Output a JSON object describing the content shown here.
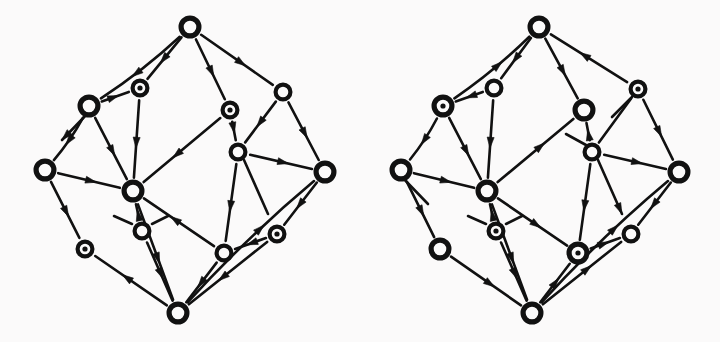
{
  "figure": {
    "background_color": "#fbfafa",
    "ink_color": "#111111",
    "width": 720,
    "height": 342,
    "panel_count": 2
  },
  "style": {
    "node_radius": 9.5,
    "node_radius_large": 11,
    "node_stroke_width": 4.2,
    "dot_radius": 2.6,
    "edge_stroke_width": 2.6,
    "arrow_length": 11,
    "arrow_width": 7
  },
  "panels": [
    {
      "id": "left-panel",
      "name": "left-graph",
      "label": "Left oriented hypercube",
      "nodes": [
        {
          "id": "L0",
          "name": "node-top",
          "x": 190,
          "y": 27,
          "kind": "ring",
          "size": "large"
        },
        {
          "id": "L1",
          "name": "node-upper-left-dot",
          "x": 140,
          "y": 88,
          "kind": "dotted",
          "size": "normal"
        },
        {
          "id": "L2",
          "name": "node-left-upper",
          "x": 89,
          "y": 106,
          "kind": "ring",
          "size": "large"
        },
        {
          "id": "L3",
          "name": "node-upper-mid-dot",
          "x": 230,
          "y": 110,
          "kind": "dotted",
          "size": "normal"
        },
        {
          "id": "L4",
          "name": "node-upper-right",
          "x": 283,
          "y": 92,
          "kind": "ring",
          "size": "normal"
        },
        {
          "id": "L5",
          "name": "node-center-right",
          "x": 238,
          "y": 152,
          "kind": "ring",
          "size": "normal"
        },
        {
          "id": "L6",
          "name": "node-left",
          "x": 45,
          "y": 170,
          "kind": "ring",
          "size": "large"
        },
        {
          "id": "L7",
          "name": "node-center-left",
          "x": 133,
          "y": 191,
          "kind": "ring",
          "size": "large"
        },
        {
          "id": "L8",
          "name": "node-right",
          "x": 325,
          "y": 172,
          "kind": "ring",
          "size": "large"
        },
        {
          "id": "L9",
          "name": "node-inner-lower",
          "x": 142,
          "y": 231,
          "kind": "ring",
          "size": "normal"
        },
        {
          "id": "L10",
          "name": "node-lower-left-dot",
          "x": 85,
          "y": 249,
          "kind": "dotted",
          "size": "normal"
        },
        {
          "id": "L11",
          "name": "node-lower-mid",
          "x": 224,
          "y": 253,
          "kind": "ring",
          "size": "normal"
        },
        {
          "id": "L12",
          "name": "node-lower-right-dot",
          "x": 277,
          "y": 234,
          "kind": "dotted",
          "size": "normal"
        },
        {
          "id": "L13",
          "name": "node-bottom",
          "x": 178,
          "y": 313,
          "kind": "ring",
          "size": "large"
        }
      ],
      "edges": [
        {
          "name": "edge-top-to-upper-left-dot",
          "from": "L0",
          "to": "L1",
          "dir": "forward",
          "curve": 0
        },
        {
          "name": "edge-top-to-left-upper",
          "from": "L0",
          "to": "L2",
          "dir": "forward",
          "curve": -7
        },
        {
          "name": "edge-top-to-upper-mid-dot",
          "from": "L0",
          "to": "L3",
          "dir": "forward",
          "curve": 0
        },
        {
          "name": "edge-top-to-upper-right",
          "from": "L0",
          "to": "L4",
          "dir": "forward",
          "curve": 0
        },
        {
          "name": "edge-upper-left-dot-to-left-upper",
          "from": "L1",
          "to": "L2",
          "dir": "backward",
          "curve": 0
        },
        {
          "name": "edge-upper-left-dot-to-center-left",
          "from": "L1",
          "to": "L7",
          "dir": "forward",
          "curve": 0
        },
        {
          "name": "edge-left-upper-to-left",
          "from": "L2",
          "to": "L6",
          "dir": "forward",
          "curve": -6
        },
        {
          "name": "edge-left-upper-to-center-left",
          "from": "L2",
          "to": "L7",
          "dir": "forward",
          "curve": 0
        },
        {
          "name": "edge-upper-mid-dot-to-center-right",
          "from": "L3",
          "to": "L5",
          "dir": "forward",
          "curve": 0
        },
        {
          "name": "edge-upper-mid-dot-to-center-left",
          "from": "L3",
          "to": "L7",
          "dir": "forward",
          "curve": 0
        },
        {
          "name": "edge-upper-right-to-center-right",
          "from": "L4",
          "to": "L5",
          "dir": "forward",
          "curve": 0
        },
        {
          "name": "edge-upper-right-to-right",
          "from": "L4",
          "to": "L8",
          "dir": "forward",
          "curve": 0
        },
        {
          "name": "edge-center-right-to-right",
          "from": "L5",
          "to": "L8",
          "dir": "forward",
          "curve": 0
        },
        {
          "name": "edge-center-right-to-lower-mid",
          "from": "L5",
          "to": "L11",
          "dir": "forward",
          "curve": 0
        },
        {
          "name": "edge-left-to-center-left",
          "from": "L6",
          "to": "L7",
          "dir": "forward",
          "curve": 0
        },
        {
          "name": "edge-left-to-lower-left-dot",
          "from": "L6",
          "to": "L10",
          "dir": "forward",
          "curve": 0
        },
        {
          "name": "edge-center-left-to-inner-lower",
          "from": "L7",
          "to": "L9",
          "dir": "backward",
          "curve": 0
        },
        {
          "name": "edge-center-left-to-lower-mid",
          "from": "L7",
          "to": "L11",
          "dir": "backward",
          "curve": 0
        },
        {
          "name": "edge-center-left-to-bottom",
          "from": "L7",
          "to": "L13",
          "dir": "forward",
          "curve": 0
        },
        {
          "name": "edge-right-to-lower-right-dot",
          "from": "L8",
          "to": "L12",
          "dir": "forward",
          "curve": 0
        },
        {
          "name": "edge-right-to-bottom",
          "from": "L8",
          "to": "L13",
          "dir": "backward",
          "curve": 8
        },
        {
          "name": "edge-inner-lower-to-bottom",
          "from": "L9",
          "to": "L13",
          "dir": "forward",
          "curve": 0
        },
        {
          "name": "edge-lower-left-dot-to-bottom",
          "from": "L10",
          "to": "L13",
          "dir": "backward",
          "curve": 0
        },
        {
          "name": "edge-lower-mid-to-lower-right-dot",
          "from": "L11",
          "to": "L12",
          "dir": "backward",
          "curve": 0
        },
        {
          "name": "edge-lower-mid-to-bottom",
          "from": "L11",
          "to": "L13",
          "dir": "forward",
          "curve": 0
        },
        {
          "name": "edge-lower-right-dot-to-bottom",
          "from": "L12",
          "to": "L13",
          "dir": "forward",
          "curve": 0
        }
      ],
      "stubs": [
        {
          "name": "stub-left-upper-inner",
          "x1": 89,
          "y1": 112,
          "x2": 62,
          "y2": 140,
          "arrow": true,
          "at": "end"
        },
        {
          "name": "stub-inner-lower-left",
          "x1": 132,
          "y1": 224,
          "x2": 114,
          "y2": 216,
          "arrow": false,
          "at": "none"
        },
        {
          "name": "stub-inner-lower-right",
          "x1": 152,
          "y1": 224,
          "x2": 168,
          "y2": 216,
          "arrow": false,
          "at": "none"
        },
        {
          "name": "stub-center-right-down",
          "x1": 244,
          "y1": 160,
          "x2": 268,
          "y2": 214,
          "arrow": false,
          "at": "none"
        }
      ]
    },
    {
      "id": "right-panel",
      "name": "right-graph",
      "label": "Right oriented hypercube",
      "nodes": [
        {
          "id": "R0",
          "name": "node-top",
          "x": 539,
          "y": 27,
          "kind": "ring",
          "size": "large"
        },
        {
          "id": "R1",
          "name": "node-upper-left",
          "x": 494,
          "y": 88,
          "kind": "ring",
          "size": "normal"
        },
        {
          "id": "R2",
          "name": "node-left-upper-dot",
          "x": 443,
          "y": 106,
          "kind": "dotted",
          "size": "large"
        },
        {
          "id": "R3",
          "name": "node-upper-mid",
          "x": 584,
          "y": 110,
          "kind": "ring",
          "size": "large"
        },
        {
          "id": "R4",
          "name": "node-upper-right-dot",
          "x": 638,
          "y": 89,
          "kind": "dotted",
          "size": "normal"
        },
        {
          "id": "R5",
          "name": "node-center-right",
          "x": 592,
          "y": 152,
          "kind": "ring",
          "size": "normal"
        },
        {
          "id": "R6",
          "name": "node-left",
          "x": 401,
          "y": 170,
          "kind": "ring",
          "size": "large"
        },
        {
          "id": "R7",
          "name": "node-center-left",
          "x": 487,
          "y": 191,
          "kind": "ring",
          "size": "large"
        },
        {
          "id": "R8",
          "name": "node-right",
          "x": 679,
          "y": 172,
          "kind": "ring",
          "size": "large"
        },
        {
          "id": "R9",
          "name": "node-inner-lower-dot",
          "x": 496,
          "y": 231,
          "kind": "dotted",
          "size": "normal"
        },
        {
          "id": "R10",
          "name": "node-lower-left",
          "x": 440,
          "y": 249,
          "kind": "ring",
          "size": "large"
        },
        {
          "id": "R11",
          "name": "node-lower-mid-dot",
          "x": 578,
          "y": 253,
          "kind": "dotted",
          "size": "large"
        },
        {
          "id": "R12",
          "name": "node-lower-right",
          "x": 631,
          "y": 234,
          "kind": "ring",
          "size": "normal"
        },
        {
          "id": "R13",
          "name": "node-bottom",
          "x": 532,
          "y": 313,
          "kind": "ring",
          "size": "large"
        }
      ],
      "edges": [
        {
          "name": "edge-top-to-upper-left",
          "from": "R0",
          "to": "R1",
          "dir": "forward",
          "curve": 0
        },
        {
          "name": "edge-top-to-left-upper-dot",
          "from": "R0",
          "to": "R2",
          "dir": "backward",
          "curve": -7
        },
        {
          "name": "edge-top-to-upper-mid",
          "from": "R0",
          "to": "R3",
          "dir": "forward",
          "curve": 0
        },
        {
          "name": "edge-top-to-upper-right-dot",
          "from": "R0",
          "to": "R4",
          "dir": "backward",
          "curve": 0
        },
        {
          "name": "edge-upper-left-to-left-upper-dot",
          "from": "R1",
          "to": "R2",
          "dir": "forward",
          "curve": 0
        },
        {
          "name": "edge-upper-left-to-center-left",
          "from": "R1",
          "to": "R7",
          "dir": "forward",
          "curve": 0
        },
        {
          "name": "edge-left-upper-dot-to-left",
          "from": "R2",
          "to": "R6",
          "dir": "forward",
          "curve": -6
        },
        {
          "name": "edge-left-upper-dot-to-center-left",
          "from": "R2",
          "to": "R7",
          "dir": "forward",
          "curve": 0
        },
        {
          "name": "edge-upper-mid-to-center-right",
          "from": "R3",
          "to": "R5",
          "dir": "backward",
          "curve": 0
        },
        {
          "name": "edge-upper-mid-to-center-left",
          "from": "R3",
          "to": "R7",
          "dir": "backward",
          "curve": 0
        },
        {
          "name": "edge-upper-right-dot-to-center-right",
          "from": "R4",
          "to": "R5",
          "dir": "none",
          "curve": 0
        },
        {
          "name": "edge-upper-right-dot-to-right",
          "from": "R4",
          "to": "R8",
          "dir": "forward",
          "curve": 0
        },
        {
          "name": "edge-center-right-to-right",
          "from": "R5",
          "to": "R8",
          "dir": "forward",
          "curve": 0
        },
        {
          "name": "edge-center-right-to-lower-mid-dot",
          "from": "R5",
          "to": "R11",
          "dir": "forward",
          "curve": 0
        },
        {
          "name": "edge-left-to-center-left",
          "from": "R6",
          "to": "R7",
          "dir": "forward",
          "curve": 0
        },
        {
          "name": "edge-left-to-lower-left",
          "from": "R6",
          "to": "R10",
          "dir": "forward",
          "curve": 0
        },
        {
          "name": "edge-center-left-to-inner-lower-dot",
          "from": "R7",
          "to": "R9",
          "dir": "backward",
          "curve": 0
        },
        {
          "name": "edge-center-left-to-lower-mid-dot",
          "from": "R7",
          "to": "R11",
          "dir": "forward",
          "curve": 0
        },
        {
          "name": "edge-center-left-to-bottom",
          "from": "R7",
          "to": "R13",
          "dir": "forward",
          "curve": 0
        },
        {
          "name": "edge-right-to-lower-right",
          "from": "R8",
          "to": "R12",
          "dir": "forward",
          "curve": 0
        },
        {
          "name": "edge-right-to-bottom",
          "from": "R8",
          "to": "R13",
          "dir": "backward",
          "curve": 8
        },
        {
          "name": "edge-inner-lower-dot-to-bottom",
          "from": "R9",
          "to": "R13",
          "dir": "forward",
          "curve": 0
        },
        {
          "name": "edge-lower-left-to-bottom",
          "from": "R10",
          "to": "R13",
          "dir": "forward",
          "curve": 0
        },
        {
          "name": "edge-lower-mid-dot-to-lower-right",
          "from": "R11",
          "to": "R12",
          "dir": "forward",
          "curve": 0
        },
        {
          "name": "edge-lower-mid-dot-to-bottom",
          "from": "R11",
          "to": "R13",
          "dir": "backward",
          "curve": 0
        },
        {
          "name": "edge-lower-right-to-bottom",
          "from": "R12",
          "to": "R13",
          "dir": "backward",
          "curve": 0
        }
      ],
      "stubs": [
        {
          "name": "stub-left-upper-inner",
          "x1": 401,
          "y1": 176,
          "x2": 428,
          "y2": 204,
          "arrow": false,
          "at": "none"
        },
        {
          "name": "stub-inner-lower-left",
          "x1": 486,
          "y1": 224,
          "x2": 468,
          "y2": 216,
          "arrow": false,
          "at": "none"
        },
        {
          "name": "stub-inner-lower-right",
          "x1": 506,
          "y1": 224,
          "x2": 522,
          "y2": 216,
          "arrow": false,
          "at": "none"
        },
        {
          "name": "stub-center-right-down",
          "x1": 598,
          "y1": 160,
          "x2": 622,
          "y2": 214,
          "arrow": true,
          "at": "end"
        },
        {
          "name": "stub-upper-right-dot-down",
          "x1": 632,
          "y1": 97,
          "x2": 612,
          "y2": 117,
          "arrow": false,
          "at": "none"
        },
        {
          "name": "stub-center-right-up",
          "x1": 586,
          "y1": 145,
          "x2": 566,
          "y2": 134,
          "arrow": false,
          "at": "none"
        }
      ]
    }
  ]
}
